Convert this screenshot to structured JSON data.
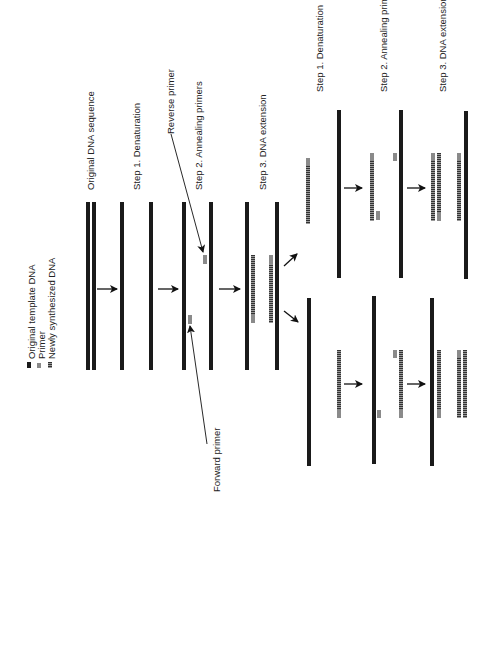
{
  "legend": {
    "items": [
      {
        "label": "Original template DNA",
        "type": "template"
      },
      {
        "label": "Primer",
        "type": "primer"
      },
      {
        "label": "Newly synthesized DNA",
        "type": "new"
      }
    ]
  },
  "cycle1": {
    "original_label": "Original DNA sequence",
    "step1_label": "Step 1. Denaturation",
    "step2_label": "Step 2. Annealing primers",
    "step3_label": "Step 3.  DNA extension",
    "reverse_primer_label": "Reverse primer",
    "forward_primer_label": "Forward primer"
  },
  "cycle2": {
    "step1_label": "Step 1. Denaturation",
    "step2_label": "Step 2. Annealing primers",
    "step3_label": "Step 3.  DNA extension"
  },
  "colors": {
    "template": "#1a1a1a",
    "primer": "#8a8a8a",
    "new_dna": "#555555",
    "background": "#ffffff"
  }
}
